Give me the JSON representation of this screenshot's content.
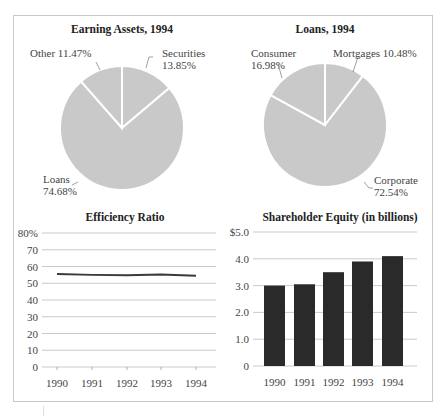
{
  "chart_data": [
    {
      "type": "pie",
      "title": "Earning Assets, 1994",
      "slices": [
        {
          "label": "Securities",
          "value": 13.85,
          "display": "13.85%"
        },
        {
          "label": "Loans",
          "value": 74.68,
          "display": "74.68%"
        },
        {
          "label": "Other",
          "value": 11.47,
          "display": "11.47%"
        }
      ],
      "color": "#c9c9c9"
    },
    {
      "type": "pie",
      "title": "Loans, 1994",
      "slices": [
        {
          "label": "Mortgages",
          "value": 10.48,
          "display": "10.48%"
        },
        {
          "label": "Corporate",
          "value": 72.54,
          "display": "72.54%"
        },
        {
          "label": "Consumer",
          "value": 16.98,
          "display": "16.98%"
        }
      ],
      "color": "#c9c9c9"
    },
    {
      "type": "line",
      "title": "Efficiency Ratio",
      "x": [
        "1990",
        "1991",
        "1992",
        "1993",
        "1994"
      ],
      "series": [
        {
          "name": "Efficiency Ratio",
          "values": [
            55.5,
            55.0,
            54.8,
            55.2,
            54.5
          ]
        }
      ],
      "yticks": [
        "0",
        "10",
        "20",
        "30",
        "40",
        "50",
        "60",
        "70",
        "80%"
      ],
      "ylim": [
        0,
        80
      ],
      "grid": true,
      "xlabel": "",
      "ylabel": ""
    },
    {
      "type": "bar",
      "title": "Shareholder Equity (in billions)",
      "categories": [
        "1990",
        "1991",
        "1992",
        "1993",
        "1994"
      ],
      "values": [
        3.0,
        3.05,
        3.5,
        3.9,
        4.1
      ],
      "yticks": [
        "0",
        "1.0",
        "2.0",
        "3.0",
        "4.0",
        "$5.0"
      ],
      "ylim": [
        0,
        5
      ],
      "grid": true,
      "bar_color": "#2a2a2a",
      "xlabel": "",
      "ylabel": ""
    }
  ],
  "labels": {
    "pie1": {
      "title": "Earning Assets, 1994",
      "other": "Other 11.47%",
      "securities_name": "Securities",
      "securities_value": "13.85%",
      "loans_name": "Loans",
      "loans_value": "74.68%"
    },
    "pie2": {
      "title": "Loans, 1994",
      "consumer_name": "Consumer",
      "consumer_value": "16.98%",
      "mortgages": "Mortgages 10.48%",
      "corporate_name": "Corporate",
      "corporate_value": "72.54%"
    },
    "line": {
      "title": "Efficiency Ratio",
      "y": [
        "80%",
        "70",
        "60",
        "50",
        "40",
        "30",
        "20",
        "10",
        "0"
      ],
      "x": [
        "1990",
        "1991",
        "1992",
        "1993",
        "1994"
      ]
    },
    "bar": {
      "title": "Shareholder Equity (in billions)",
      "y": [
        "$5.0",
        "4.0",
        "3.0",
        "2.0",
        "1.0",
        "0"
      ],
      "x": [
        "1990",
        "1991",
        "1992",
        "1993",
        "1994"
      ]
    }
  }
}
